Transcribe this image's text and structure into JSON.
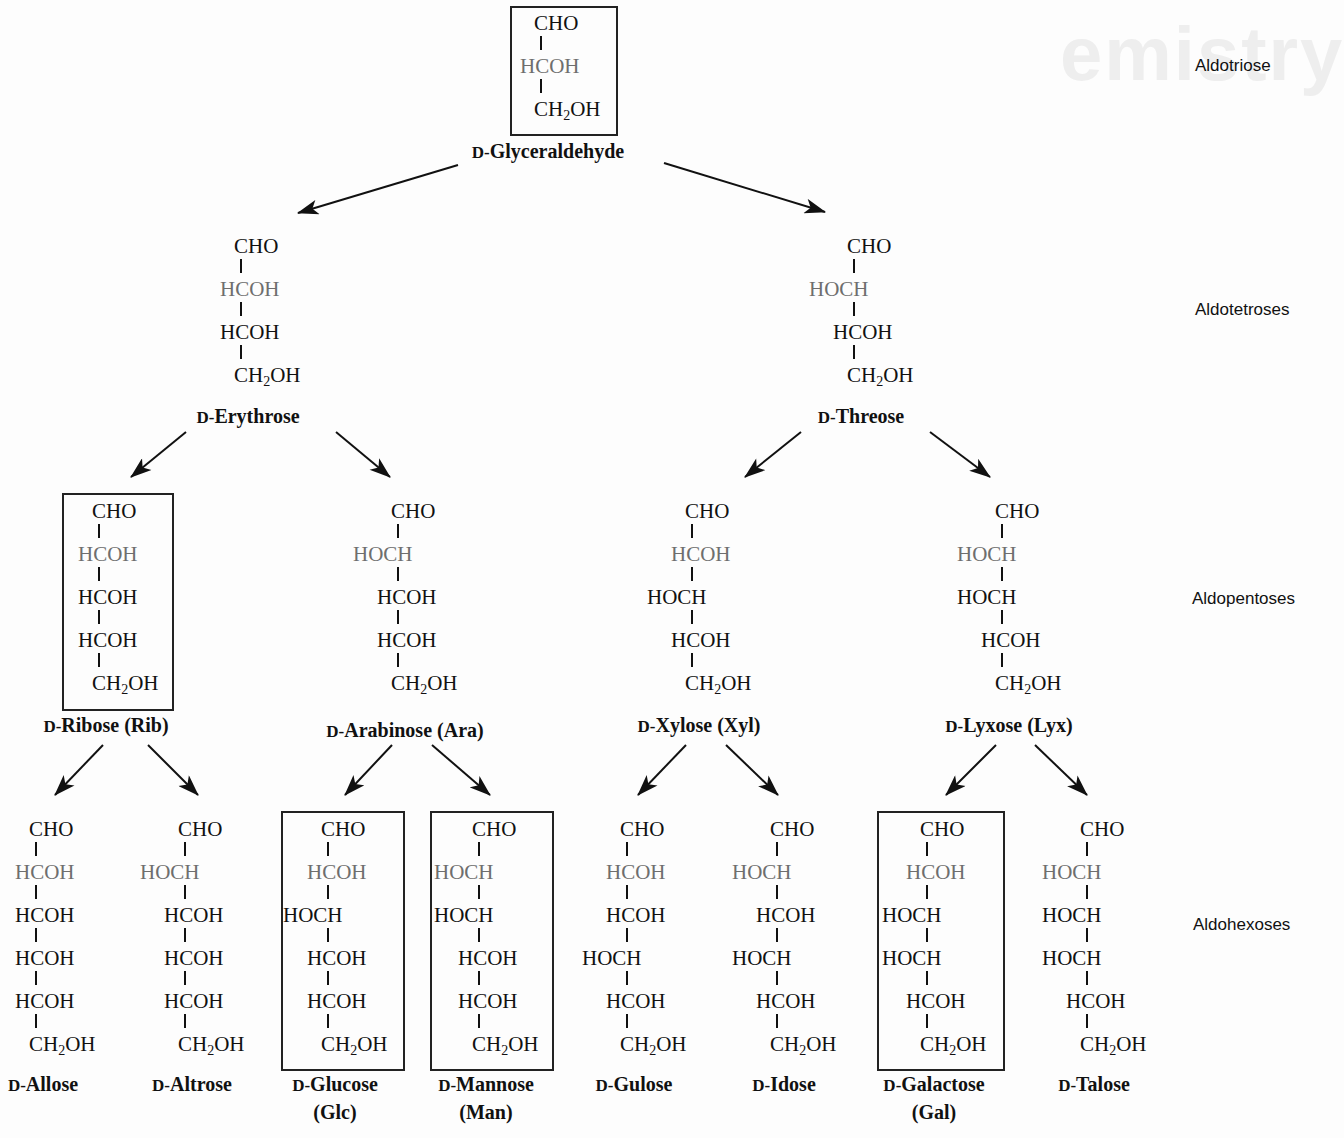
{
  "classes": {
    "triose": "Aldotriose",
    "tetroses": "Aldotetroses",
    "pentoses": "Aldopentoses",
    "hexoses": "Aldohexoses"
  },
  "prefix": "D-",
  "molecules": {
    "glyceraldehyde": {
      "name": "Glyceraldehyde",
      "abbr": "",
      "boxed": true,
      "rows": [
        "CHO",
        "HCOH",
        "CH2OH"
      ]
    },
    "erythrose": {
      "name": "Erythrose",
      "abbr": "",
      "boxed": false,
      "rows": [
        "CHO",
        "HCOH",
        "HCOH",
        "CH2OH"
      ]
    },
    "threose": {
      "name": "Threose",
      "abbr": "",
      "boxed": false,
      "rows": [
        "CHO",
        "HOCH",
        "HCOH",
        "CH2OH"
      ]
    },
    "ribose": {
      "name": "Ribose",
      "abbr": "(Rib)",
      "boxed": true,
      "rows": [
        "CHO",
        "HCOH",
        "HCOH",
        "HCOH",
        "CH2OH"
      ]
    },
    "arabinose": {
      "name": "Arabinose",
      "abbr": "(Ara)",
      "boxed": false,
      "rows": [
        "CHO",
        "HOCH",
        "HCOH",
        "HCOH",
        "CH2OH"
      ]
    },
    "xylose": {
      "name": "Xylose",
      "abbr": "(Xyl)",
      "boxed": false,
      "rows": [
        "CHO",
        "HCOH",
        "HOCH",
        "HCOH",
        "CH2OH"
      ]
    },
    "lyxose": {
      "name": "Lyxose",
      "abbr": "(Lyx)",
      "boxed": false,
      "rows": [
        "CHO",
        "HOCH",
        "HOCH",
        "HCOH",
        "CH2OH"
      ]
    },
    "allose": {
      "name": "Allose",
      "abbr": "",
      "boxed": false,
      "rows": [
        "CHO",
        "HCOH",
        "HCOH",
        "HCOH",
        "HCOH",
        "CH2OH"
      ]
    },
    "altrose": {
      "name": "Altrose",
      "abbr": "",
      "boxed": false,
      "rows": [
        "CHO",
        "HOCH",
        "HCOH",
        "HCOH",
        "HCOH",
        "CH2OH"
      ]
    },
    "glucose": {
      "name": "Glucose",
      "abbr": "(Glc)",
      "boxed": true,
      "rows": [
        "CHO",
        "HCOH",
        "HOCH",
        "HCOH",
        "HCOH",
        "CH2OH"
      ]
    },
    "mannose": {
      "name": "Mannose",
      "abbr": "(Man)",
      "boxed": true,
      "rows": [
        "CHO",
        "HOCH",
        "HOCH",
        "HCOH",
        "HCOH",
        "CH2OH"
      ]
    },
    "gulose": {
      "name": "Gulose",
      "abbr": "",
      "boxed": false,
      "rows": [
        "CHO",
        "HCOH",
        "HCOH",
        "HOCH",
        "HCOH",
        "CH2OH"
      ]
    },
    "idose": {
      "name": "Idose",
      "abbr": "",
      "boxed": false,
      "rows": [
        "CHO",
        "HOCH",
        "HCOH",
        "HOCH",
        "HCOH",
        "CH2OH"
      ]
    },
    "galactose": {
      "name": "Galactose",
      "abbr": "(Gal)",
      "boxed": true,
      "rows": [
        "CHO",
        "HCOH",
        "HOCH",
        "HOCH",
        "HCOH",
        "CH2OH"
      ]
    },
    "talose": {
      "name": "Talose",
      "abbr": "",
      "boxed": false,
      "rows": [
        "CHO",
        "HOCH",
        "HOCH",
        "HOCH",
        "HCOH",
        "CH2OH"
      ]
    }
  },
  "edges": [
    [
      "glyceraldehyde",
      "erythrose"
    ],
    [
      "glyceraldehyde",
      "threose"
    ],
    [
      "erythrose",
      "ribose"
    ],
    [
      "erythrose",
      "arabinose"
    ],
    [
      "threose",
      "xylose"
    ],
    [
      "threose",
      "lyxose"
    ],
    [
      "ribose",
      "allose"
    ],
    [
      "ribose",
      "altrose"
    ],
    [
      "arabinose",
      "glucose"
    ],
    [
      "arabinose",
      "mannose"
    ],
    [
      "xylose",
      "gulose"
    ],
    [
      "xylose",
      "idose"
    ],
    [
      "lyxose",
      "galactose"
    ],
    [
      "lyxose",
      "talose"
    ]
  ]
}
